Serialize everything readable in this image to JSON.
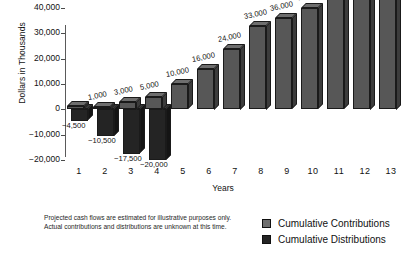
{
  "chart_data": {
    "type": "bar",
    "title": "",
    "subtitle": "",
    "xlabel": "Years",
    "ylabel": "Dollars in Thousands",
    "categories": [
      "1",
      "2",
      "3",
      "4",
      "5",
      "6",
      "7",
      "8",
      "9",
      "10",
      "11",
      "12",
      "13"
    ],
    "ylim": [
      -20000,
      40000
    ],
    "ytick_labels": [
      "40,000",
      "30,000",
      "20,000",
      "10,000",
      "0",
      "−10,000",
      "−20,000"
    ],
    "ytick_values": [
      40000,
      30000,
      20000,
      10000,
      0,
      -10000,
      -20000
    ],
    "grid": false,
    "legend_position": "bottom-right",
    "series": [
      {
        "name": "Cumulative Contributions",
        "color": "#6e6e6e",
        "values": [
          0,
          1000,
          3000,
          5000,
          10000,
          16000,
          24000,
          33000,
          36000,
          40000,
          45000,
          48000,
          50000
        ],
        "data_labels": [
          "",
          "1,000",
          "3,000",
          "5,000",
          "10,000",
          "16,000",
          "24,000",
          "33,000",
          "36,000",
          "40,000",
          "45,000",
          "48,000",
          "50,000"
        ]
      },
      {
        "name": "Cumulative Distributions",
        "color": "#242424",
        "values": [
          -4500,
          -10500,
          -17500,
          -20000,
          0,
          0,
          0,
          0,
          0,
          0,
          0,
          0,
          0
        ],
        "data_labels": [
          "−4,500",
          "−10,500",
          "−17,500",
          "−20,000",
          "",
          "",
          "",
          "",
          "",
          "",
          "",
          "",
          ""
        ]
      }
    ]
  },
  "legend": {
    "items": [
      {
        "label": "Cumulative Contributions",
        "color": "#6e6e6e"
      },
      {
        "label": "Cumulative Distributions",
        "color": "#242424"
      }
    ]
  },
  "footnote": {
    "text": "Projected cash flows are estimated for illustrative purposes only. Actual contributions and distributions are unknown at this time."
  }
}
